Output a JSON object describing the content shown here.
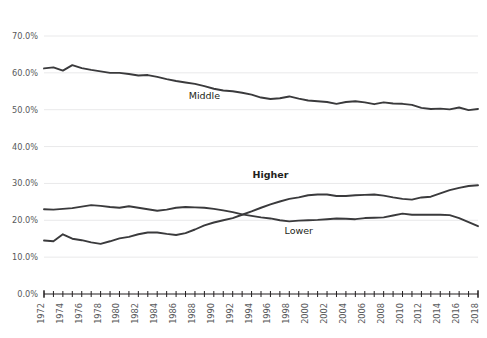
{
  "chart_data": {
    "type": "line",
    "title": "",
    "subtitle": "",
    "xlabel": "",
    "ylabel": "",
    "xlim": [
      1972,
      2018
    ],
    "ylim": [
      0,
      70
    ],
    "grid": true,
    "legend_position": "inline-labels",
    "ytick_labels": [
      "0.0%",
      "10.0%",
      "20.0%",
      "30.0%",
      "40.0%",
      "50.0%",
      "60.0%",
      "70.0%"
    ],
    "ytick_values": [
      0,
      10,
      20,
      30,
      40,
      50,
      60,
      70
    ],
    "xtick_labels": [
      "1972",
      "1974",
      "1976",
      "1978",
      "1980",
      "1982",
      "1984",
      "1986",
      "1988",
      "1990",
      "1992",
      "1994",
      "1996",
      "1998",
      "2000",
      "2002",
      "2004",
      "2006",
      "2008",
      "2010",
      "2012",
      "2014",
      "2016",
      "2018"
    ],
    "xtick_values": [
      1972,
      1974,
      1976,
      1978,
      1980,
      1982,
      1984,
      1986,
      1988,
      1990,
      1992,
      1994,
      1996,
      1998,
      2000,
      2002,
      2004,
      2006,
      2008,
      2010,
      2012,
      2014,
      2016,
      2018
    ],
    "x": [
      1972,
      1973,
      1974,
      1975,
      1976,
      1977,
      1978,
      1979,
      1980,
      1981,
      1982,
      1983,
      1984,
      1985,
      1986,
      1987,
      1988,
      1989,
      1990,
      1991,
      1992,
      1993,
      1994,
      1995,
      1996,
      1997,
      1998,
      1999,
      2000,
      2001,
      2002,
      2003,
      2004,
      2005,
      2006,
      2007,
      2008,
      2009,
      2010,
      2011,
      2012,
      2013,
      2014,
      2015,
      2016,
      2017,
      2018
    ],
    "series": [
      {
        "name": "Middle",
        "color": "#3a3a3c",
        "label_x": 1989,
        "label_y": 53.0,
        "bold": false,
        "values": [
          61.2,
          61.5,
          60.6,
          62.1,
          61.3,
          60.8,
          60.4,
          60.0,
          60.0,
          59.7,
          59.3,
          59.4,
          58.9,
          58.3,
          57.8,
          57.4,
          57.0,
          56.4,
          55.7,
          55.2,
          55.0,
          54.6,
          54.1,
          53.3,
          52.9,
          53.1,
          53.6,
          53.0,
          52.5,
          52.3,
          52.1,
          51.6,
          52.1,
          52.3,
          52.0,
          51.5,
          52.0,
          51.7,
          51.6,
          51.3,
          50.5,
          50.2,
          50.3,
          50.1,
          50.6,
          49.9,
          50.2
        ]
      },
      {
        "name": "Higher",
        "color": "#3a3a3c",
        "label_x": 1996,
        "label_y": 31.5,
        "bold": true,
        "values": [
          14.5,
          14.3,
          16.2,
          15.0,
          14.6,
          14.0,
          13.6,
          14.3,
          15.1,
          15.5,
          16.2,
          16.7,
          16.7,
          16.3,
          16.0,
          16.5,
          17.5,
          18.6,
          19.4,
          20.0,
          20.6,
          21.5,
          22.4,
          23.4,
          24.3,
          25.1,
          25.8,
          26.2,
          26.8,
          27.0,
          27.0,
          26.6,
          26.6,
          26.8,
          26.9,
          27.0,
          26.7,
          26.2,
          25.8,
          25.6,
          26.2,
          26.4,
          27.3,
          28.2,
          28.8,
          29.3,
          29.5
        ]
      },
      {
        "name": "Lower",
        "color": "#3a3a3c",
        "label_x": 1999,
        "label_y": 16.3,
        "bold": false,
        "values": [
          23.0,
          22.9,
          23.1,
          23.3,
          23.7,
          24.1,
          23.9,
          23.6,
          23.4,
          23.8,
          23.4,
          23.0,
          22.6,
          22.9,
          23.4,
          23.6,
          23.5,
          23.4,
          23.1,
          22.7,
          22.2,
          21.6,
          21.2,
          20.8,
          20.5,
          20.0,
          19.7,
          19.9,
          20.0,
          20.1,
          20.3,
          20.5,
          20.4,
          20.3,
          20.6,
          20.7,
          20.8,
          21.3,
          21.8,
          21.5,
          21.5,
          21.5,
          21.5,
          21.4,
          20.6,
          19.5,
          18.4
        ]
      }
    ]
  }
}
